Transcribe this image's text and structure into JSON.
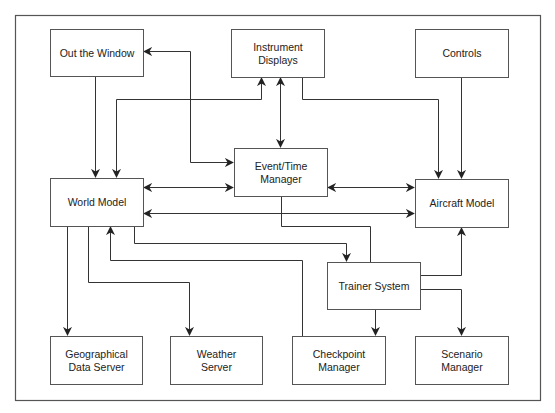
{
  "diagram": {
    "type": "block-diagram",
    "colors": {
      "line": "#333333",
      "box_border": "#555555",
      "text": "#222222",
      "background": "#ffffff"
    },
    "nodes": {
      "out_the_window": {
        "label": "Out the Window"
      },
      "instrument_displays": {
        "label": "Instrument\nDisplays"
      },
      "controls": {
        "label": "Controls"
      },
      "world_model": {
        "label": "World Model"
      },
      "event_time_manager": {
        "label": "Event/Time\nManager"
      },
      "aircraft_model": {
        "label": "Aircraft Model"
      },
      "trainer_system": {
        "label": "Trainer System"
      },
      "geographical_data_server": {
        "label": "Geographical\nData Server"
      },
      "weather_server": {
        "label": "Weather\nServer"
      },
      "checkpoint_manager": {
        "label": "Checkpoint\nManager"
      },
      "scenario_manager": {
        "label": "Scenario\nManager"
      }
    },
    "edges": [
      {
        "from": "Out the Window",
        "to": "World Model",
        "direction": "one-way"
      },
      {
        "from": "World Model",
        "to": "Instrument Displays",
        "direction": "two-way"
      },
      {
        "from": "Event/Time Manager",
        "to": "Out the Window",
        "direction": "two-way"
      },
      {
        "from": "Instrument Displays",
        "to": "Event/Time Manager",
        "direction": "two-way"
      },
      {
        "from": "Instrument Displays",
        "to": "Aircraft Model",
        "direction": "one-way"
      },
      {
        "from": "Controls",
        "to": "Aircraft Model",
        "direction": "one-way"
      },
      {
        "from": "World Model",
        "to": "Event/Time Manager",
        "direction": "two-way"
      },
      {
        "from": "Event/Time Manager",
        "to": "Aircraft Model",
        "direction": "two-way"
      },
      {
        "from": "World Model",
        "to": "Aircraft Model",
        "direction": "two-way"
      },
      {
        "from": "Event/Time Manager",
        "to": "Trainer System",
        "direction": "none"
      },
      {
        "from": "World Model",
        "to": "Trainer System",
        "direction": "one-way"
      },
      {
        "from": "Trainer System",
        "to": "Aircraft Model",
        "direction": "one-way"
      },
      {
        "from": "Trainer System",
        "to": "Scenario Manager",
        "direction": "one-way"
      },
      {
        "from": "Trainer System",
        "to": "Checkpoint Manager",
        "direction": "one-way"
      },
      {
        "from": "Checkpoint Manager",
        "to": "World Model",
        "direction": "one-way"
      },
      {
        "from": "World Model",
        "to": "Geographical Data Server",
        "direction": "one-way"
      },
      {
        "from": "World Model",
        "to": "Weather Server",
        "direction": "one-way"
      }
    ]
  }
}
